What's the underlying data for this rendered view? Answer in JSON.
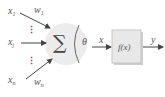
{
  "diagram": {
    "type": "perceptron-neuron",
    "inputs": [
      {
        "name": "x",
        "sub": "1",
        "weight": "w",
        "weight_sub": "1"
      },
      {
        "name": "x",
        "sub": "j",
        "weight": "",
        "weight_sub": ""
      },
      {
        "name": "x",
        "sub": "n",
        "weight": "w",
        "weight_sub": "n"
      }
    ],
    "summation_symbol": "∑",
    "threshold_symbol": "θ",
    "intermediate_label": "x",
    "activation_label": "f(x)",
    "output_label": "y",
    "ellipsis": "⋮",
    "colors": {
      "node_fill": "#ececec",
      "box_fill": "#e6e6e6",
      "stroke": "#555555",
      "text": "#555555"
    }
  }
}
